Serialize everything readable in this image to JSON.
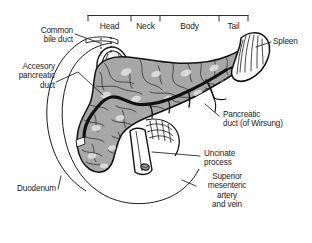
{
  "figure": {
    "type": "anatomical-illustration",
    "background_color": "#ffffff",
    "ink_color": "#1a1a1a",
    "pancreas_fill": "#a8a8a8",
    "duct_color": "#111111",
    "spleen_fill": "#fdfdfd"
  },
  "segment_bracket": {
    "segments": [
      {
        "label": "Head"
      },
      {
        "label": "Neck"
      },
      {
        "label": "Body"
      },
      {
        "label": "Tail"
      }
    ]
  },
  "labels": {
    "common_bile_duct": "Common\nbile duct",
    "accessory_pancreatic_duct": "Accesory\npancreatic\nduct",
    "duodenum": "Duodenum",
    "spleen": "Spleen",
    "pancreatic_duct": "Pancreatic\nduct (of Wirsung)",
    "uncinate_process": "Uncinate\nprocess",
    "superior_mesenteric": "Superior\nmesenteric\nartery\nand vein"
  }
}
